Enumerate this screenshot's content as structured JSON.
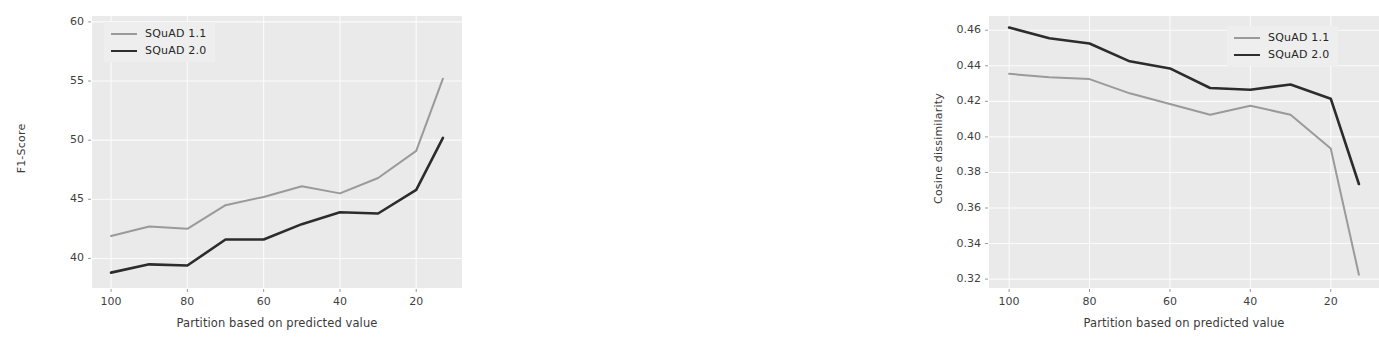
{
  "figure": {
    "panels": [
      {
        "id": "left",
        "xlabel": "Partition based on predicted value",
        "ylabel": "F1-Score",
        "yticks": [
          "60",
          "55",
          "50",
          "45",
          "40"
        ],
        "xticks": [
          "100",
          "80",
          "60",
          "40",
          "20"
        ],
        "legend": [
          {
            "label": "SQuAD 1.1",
            "color": "#9a9a9a"
          },
          {
            "label": "SQuAD 2.0",
            "color": "#2c2c2c"
          }
        ]
      },
      {
        "id": "right",
        "xlabel": "Partition based on predicted value",
        "ylabel": "Cosine dissimilarity",
        "yticks": [
          "0.46",
          "0.44",
          "0.42",
          "0.40",
          "0.38",
          "0.36",
          "0.34",
          "0.32"
        ],
        "xticks": [
          "100",
          "80",
          "60",
          "40",
          "20"
        ],
        "legend": [
          {
            "label": "SQuAD 1.1",
            "color": "#9a9a9a"
          },
          {
            "label": "SQuAD 2.0",
            "color": "#2c2c2c"
          }
        ]
      }
    ]
  },
  "chart_data": [
    {
      "type": "line",
      "title": "",
      "xlabel": "Partition based on predicted value",
      "ylabel": "F1-Score",
      "xlim": [
        105,
        8
      ],
      "ylim": [
        37.5,
        60.5
      ],
      "xticks": [
        100,
        80,
        60,
        40,
        20
      ],
      "yticks": [
        60,
        55,
        50,
        45,
        40
      ],
      "grid": true,
      "legend_position": "upper left",
      "x": [
        100,
        90,
        80,
        70,
        60,
        50,
        40,
        30,
        20,
        13
      ],
      "series": [
        {
          "name": "SQuAD 1.1",
          "color": "#9a9a9a",
          "values": [
            41.9,
            42.7,
            42.5,
            44.5,
            45.2,
            46.1,
            45.5,
            46.8,
            49.1,
            55.2
          ]
        },
        {
          "name": "SQuAD 2.0",
          "color": "#2c2c2c",
          "values": [
            38.8,
            39.5,
            39.4,
            41.6,
            41.6,
            42.9,
            43.9,
            43.8,
            45.8,
            50.2
          ]
        }
      ]
    },
    {
      "type": "line",
      "title": "",
      "xlabel": "Partition based on predicted value",
      "ylabel": "Cosine dissimilarity",
      "xlim": [
        105,
        8
      ],
      "ylim": [
        0.315,
        0.468
      ],
      "xticks": [
        100,
        80,
        60,
        40,
        20
      ],
      "yticks": [
        0.46,
        0.44,
        0.42,
        0.4,
        0.38,
        0.36,
        0.34,
        0.32
      ],
      "grid": true,
      "legend_position": "upper right",
      "x": [
        100,
        90,
        80,
        70,
        60,
        50,
        40,
        30,
        20,
        13
      ],
      "series": [
        {
          "name": "SQuAD 1.1",
          "color": "#9a9a9a",
          "values": [
            0.4355,
            0.4335,
            0.4325,
            0.4245,
            0.4185,
            0.4125,
            0.4175,
            0.4125,
            0.3935,
            0.3225
          ]
        },
        {
          "name": "SQuAD 2.0",
          "color": "#2c2c2c",
          "values": [
            0.4615,
            0.4555,
            0.4525,
            0.4425,
            0.4385,
            0.4275,
            0.4265,
            0.4295,
            0.4215,
            0.3735
          ]
        }
      ]
    }
  ]
}
